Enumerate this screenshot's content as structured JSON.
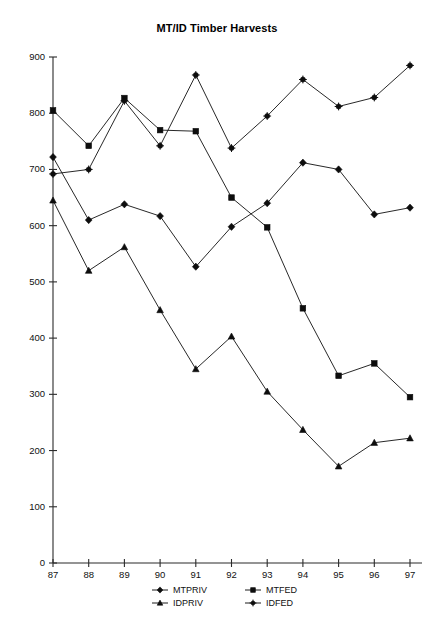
{
  "chart_data": {
    "type": "line",
    "title": "MT/ID Timber Harvests",
    "xlabel": "",
    "ylabel": "",
    "categories": [
      "87",
      "88",
      "89",
      "90",
      "91",
      "92",
      "93",
      "94",
      "95",
      "96",
      "97"
    ],
    "x": [
      87,
      88,
      89,
      90,
      91,
      92,
      93,
      94,
      95,
      96,
      97
    ],
    "xlim": [
      87,
      97
    ],
    "ylim": [
      0,
      900
    ],
    "yticks": [
      0,
      100,
      200,
      300,
      400,
      500,
      600,
      700,
      800,
      900
    ],
    "xticks": [
      "87",
      "88",
      "89",
      "90",
      "91",
      "92",
      "93",
      "94",
      "95",
      "96",
      "97"
    ],
    "grid": false,
    "legend_position": "bottom",
    "series": [
      {
        "name": "MTPRIV",
        "marker": "diamond",
        "values": [
          722,
          610,
          638,
          617,
          527,
          598,
          640,
          712,
          700,
          620,
          632
        ]
      },
      {
        "name": "MTFED",
        "marker": "square",
        "values": [
          805,
          742,
          827,
          770,
          768,
          650,
          597,
          453,
          333,
          355,
          295
        ]
      },
      {
        "name": "IDPRIV",
        "marker": "triangle",
        "values": [
          645,
          520,
          562,
          450,
          345,
          403,
          305,
          237,
          172,
          214,
          222
        ]
      },
      {
        "name": "IDFED",
        "marker": "star",
        "values": [
          692,
          700,
          822,
          742,
          868,
          738,
          795,
          860,
          812,
          828,
          885
        ]
      }
    ]
  },
  "legend": {
    "entries": [
      {
        "label": "MTPRIV"
      },
      {
        "label": "MTFED"
      },
      {
        "label": "IDPRIV"
      },
      {
        "label": "IDFED"
      }
    ]
  },
  "colors": {
    "ink": "#1c1c1c",
    "background": "#ffffff"
  }
}
